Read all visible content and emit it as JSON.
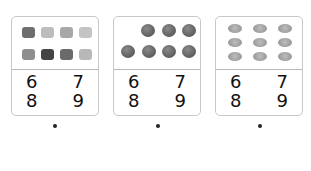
{
  "cards": [
    {
      "object": "cans",
      "count": 8,
      "options": [
        "6",
        "7",
        "8",
        "9"
      ]
    },
    {
      "object": "apples",
      "count": 7,
      "options": [
        "6",
        "7",
        "8",
        "9"
      ]
    },
    {
      "object": "cookies",
      "count": 9,
      "options": [
        "6",
        "7",
        "8",
        "9"
      ]
    }
  ],
  "colors": {
    "border": "#c8c8c8",
    "text": "#111111",
    "object_dark": "#555555",
    "object_light": "#bbbbbb"
  }
}
